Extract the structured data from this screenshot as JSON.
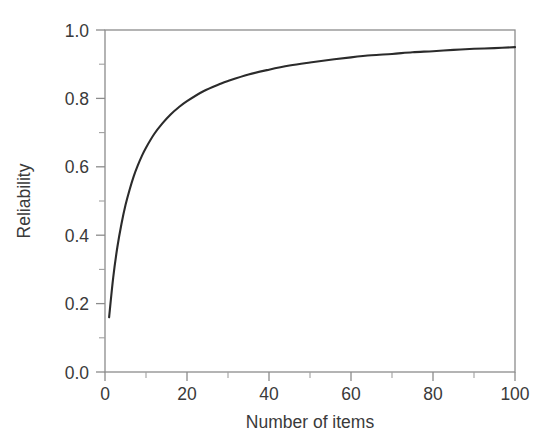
{
  "chart_data": {
    "type": "line",
    "title": "",
    "subtitle": "",
    "xlabel": "Number of items",
    "ylabel": "Reliability",
    "xlim": [
      0,
      100
    ],
    "ylim": [
      0.0,
      1.0
    ],
    "grid": false,
    "legend": null,
    "legend_position": "none",
    "annotations": [],
    "line_color": "#2b2b2b",
    "axis_color": "#8c8c8c",
    "background_color": "#ffffff",
    "x_ticks_major": [
      0,
      20,
      40,
      60,
      80,
      100
    ],
    "x_tick_labels": [
      "0",
      "20",
      "40",
      "60",
      "80",
      "100"
    ],
    "x_ticks_minor": [
      10,
      30,
      50,
      70,
      90
    ],
    "y_ticks_major": [
      0.0,
      0.2,
      0.4,
      0.6,
      0.8,
      1.0
    ],
    "y_tick_labels": [
      "0.0",
      "0.2",
      "0.4",
      "0.6",
      "0.8",
      "1.0"
    ],
    "y_ticks_minor": [
      0.1,
      0.3,
      0.5,
      0.7,
      0.9
    ],
    "series": [
      {
        "name": "Reliability (Spearman-Brown, r1 = 0.16)",
        "x": [
          1,
          2,
          3,
          4,
          5,
          6,
          7,
          8,
          9,
          10,
          12,
          14,
          16,
          18,
          20,
          24,
          28,
          30,
          35,
          40,
          45,
          50,
          55,
          60,
          65,
          70,
          75,
          80,
          85,
          90,
          95,
          100
        ],
        "values": [
          0.16,
          0.276,
          0.364,
          0.432,
          0.488,
          0.533,
          0.572,
          0.604,
          0.632,
          0.656,
          0.696,
          0.727,
          0.753,
          0.774,
          0.792,
          0.821,
          0.842,
          0.851,
          0.87,
          0.884,
          0.896,
          0.905,
          0.913,
          0.92,
          0.926,
          0.93,
          0.935,
          0.938,
          0.942,
          0.945,
          0.947,
          0.95
        ]
      }
    ]
  },
  "axes": {
    "y_title": "Reliability",
    "x_title": "Number of items",
    "x_labels": [
      "0",
      "20",
      "40",
      "60",
      "80",
      "100"
    ],
    "y_labels": [
      "0.0",
      "0.2",
      "0.4",
      "0.6",
      "0.8",
      "1.0"
    ]
  }
}
